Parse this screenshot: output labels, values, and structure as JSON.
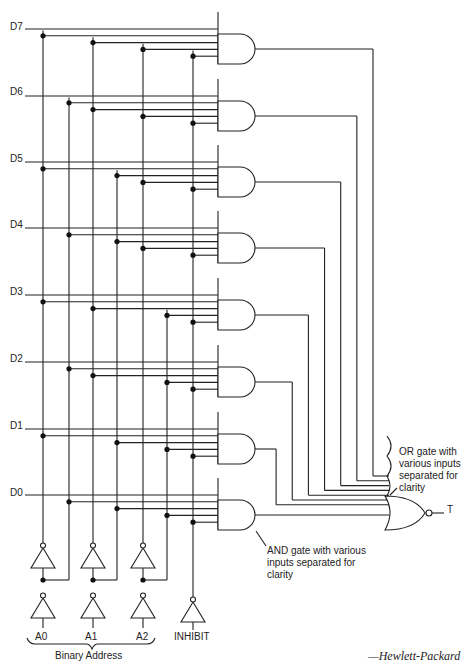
{
  "diagram": {
    "type": "8-to-1 multiplexer logic circuit",
    "data_inputs": [
      "D7",
      "D6",
      "D5",
      "D4",
      "D3",
      "D2",
      "D1",
      "D0"
    ],
    "address_inputs": [
      "A0",
      "A1",
      "A2"
    ],
    "inhibit_label": "INHIBIT",
    "address_group_label": "Binary Address",
    "output_label": "T",
    "or_gate_note": [
      "OR gate with",
      "various inputs",
      "separated for",
      "clarity"
    ],
    "and_gate_note": [
      "AND gate with various",
      "inputs separated for",
      "clarity"
    ],
    "credit": "—Hewlett-Packard",
    "colors": {
      "line": "#222222",
      "background": "#ffffff"
    }
  }
}
